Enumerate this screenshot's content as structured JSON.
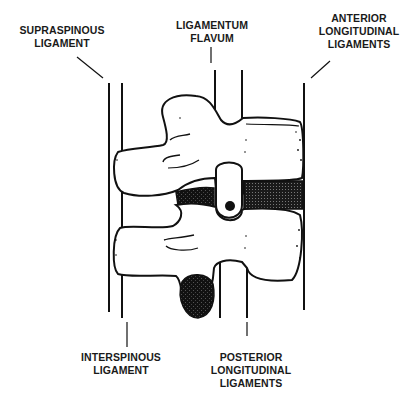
{
  "diagram": {
    "colors": {
      "ink": "#111111",
      "background": "#ffffff",
      "disc_fill": "#2a2a2a"
    },
    "labels": [
      {
        "id": "supraspinous",
        "lines": [
          "SUPRASPINOUS",
          "LIGAMENT"
        ]
      },
      {
        "id": "ligamentum_flavum",
        "lines": [
          "LIGAMENTUM",
          "FLAVUM"
        ]
      },
      {
        "id": "anterior_longitudinal",
        "lines": [
          "ANTERIOR",
          "LONGITUDINAL",
          "LIGAMENTS"
        ]
      },
      {
        "id": "interspinous",
        "lines": [
          "INTERSPINOUS",
          "LIGAMENT"
        ]
      },
      {
        "id": "posterior_longitudinal",
        "lines": [
          "POSTERIOR",
          "LONGITUDINAL",
          "LIGAMENTS"
        ]
      }
    ]
  }
}
